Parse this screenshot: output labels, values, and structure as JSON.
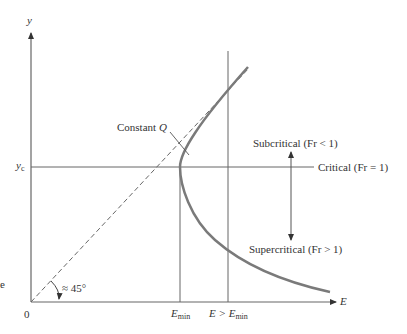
{
  "diagram": {
    "type": "specific-energy-diagram",
    "axes": {
      "y_label": "y",
      "x_label": "E",
      "origin_label": "0"
    },
    "labels": {
      "yc": {
        "main": "y",
        "sub": "c"
      },
      "constant_q": {
        "prefix": "Constant ",
        "var": "Q"
      },
      "subcritical": "Subcritical (Fr < 1)",
      "critical": "Critical (Fr = 1)",
      "supercritical": "Supercritical (Fr > 1)",
      "angle": "≈ 45°",
      "emin": {
        "main": "E",
        "sub": "min"
      },
      "e_gt_emin": {
        "prefix": "E > E",
        "sub": "min"
      },
      "edge_fragment": "e"
    },
    "colors": {
      "curve": "#7a7a7a",
      "lines": "#555555",
      "text": "#333333"
    }
  }
}
